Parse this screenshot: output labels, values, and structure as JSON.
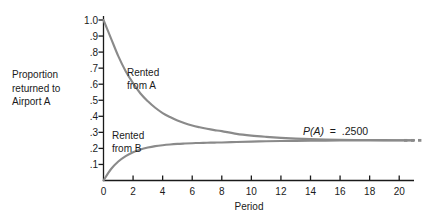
{
  "chart_data": {
    "type": "line",
    "title": "",
    "subtitle": "",
    "xlabel": "Period",
    "ylabel": "Proportion returned to Airport A",
    "ylabel_lines": [
      "Proportion",
      "returned to",
      "Airport A"
    ],
    "xlim": [
      0,
      21
    ],
    "ylim": [
      0,
      1.0
    ],
    "grid": false,
    "legend_position": "inline-annotations",
    "x_ticks": [
      0,
      2,
      4,
      6,
      8,
      10,
      12,
      14,
      16,
      18,
      20
    ],
    "x_tick_labels": [
      "0",
      "2",
      "4",
      "6",
      "8",
      "10",
      "12",
      "14",
      "16",
      "18",
      "20"
    ],
    "y_ticks": [
      0.1,
      0.2,
      0.3,
      0.4,
      0.5,
      0.6,
      0.7,
      0.8,
      0.9,
      1.0
    ],
    "y_tick_labels": [
      ".1",
      ".2",
      ".3",
      ".4",
      ".5",
      ".6",
      ".7",
      ".8",
      ".9",
      "1.0"
    ],
    "series": [
      {
        "name": "Rented from A",
        "label": "Rented from A",
        "label_lines": [
          "Rented",
          "from A"
        ],
        "color": "#8a8a8a",
        "x": [
          0,
          0.5,
          1,
          1.5,
          2,
          2.5,
          3,
          3.5,
          4,
          4.5,
          5,
          5.5,
          6,
          6.5,
          7,
          7.5,
          8,
          9,
          10,
          11,
          12,
          13,
          14,
          15,
          16,
          17,
          18,
          19,
          20,
          21
        ],
        "values": [
          1.0,
          0.8875,
          0.775,
          0.6813,
          0.6063,
          0.5422,
          0.4938,
          0.4531,
          0.4203,
          0.3953,
          0.3734,
          0.3563,
          0.3422,
          0.3313,
          0.3219,
          0.3141,
          0.3078,
          0.2906,
          0.2797,
          0.2719,
          0.2656,
          0.2609,
          0.2578,
          0.2555,
          0.2539,
          0.2527,
          0.2519,
          0.2513,
          0.2509,
          0.2506
        ]
      },
      {
        "name": "Rented from B",
        "label": "Rented from B",
        "label_lines": [
          "Rented",
          "from B"
        ],
        "color": "#8a8a8a",
        "x": [
          0,
          0.5,
          1,
          1.5,
          2,
          2.5,
          3,
          3.5,
          4,
          4.5,
          5,
          5.5,
          6,
          6.5,
          7,
          7.5,
          8,
          9,
          10,
          11,
          12,
          13,
          14,
          15,
          16,
          17,
          18,
          19,
          20,
          21
        ],
        "values": [
          0.0,
          0.07,
          0.118,
          0.152,
          0.176,
          0.193,
          0.205,
          0.214,
          0.22,
          0.2245,
          0.228,
          0.2305,
          0.2325,
          0.234,
          0.2352,
          0.2362,
          0.237,
          0.24,
          0.2425,
          0.2445,
          0.246,
          0.247,
          0.2478,
          0.2484,
          0.2488,
          0.2491,
          0.2494,
          0.2496,
          0.2497,
          0.2498
        ]
      }
    ],
    "asymptote": {
      "value": 0.25,
      "annotation": "P(A)  =  .2500",
      "annotation_symbol": "P(A)",
      "annotation_operator": "=",
      "annotation_value": ".2500",
      "continuation": "…"
    },
    "axis_color": "#1a1a1a",
    "curve_color": "#8a8a8a"
  }
}
